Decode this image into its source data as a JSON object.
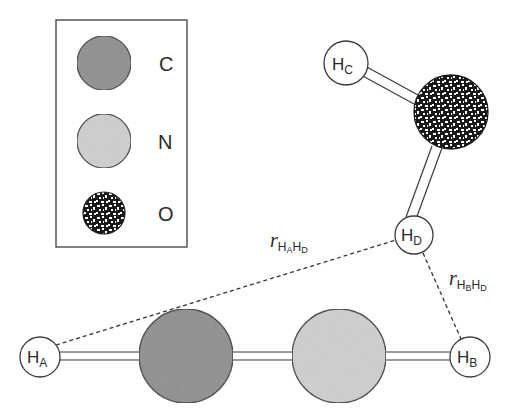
{
  "figure": {
    "type": "molecular-diagram"
  },
  "legend": {
    "items": [
      {
        "element": "C",
        "label": "C",
        "fill": "#8e8e8e",
        "pattern": "solid"
      },
      {
        "element": "N",
        "label": "N",
        "fill": "#cfcfcf",
        "pattern": "solid"
      },
      {
        "element": "O",
        "label": "O",
        "fill": "#1a1a1a",
        "pattern": "speckled"
      }
    ]
  },
  "atoms": {
    "HA": {
      "main": "H",
      "sub": "A"
    },
    "HB": {
      "main": "H",
      "sub": "B"
    },
    "HC": {
      "main": "H",
      "sub": "C"
    },
    "HD": {
      "main": "H",
      "sub": "D"
    },
    "C": {
      "element": "C"
    },
    "N": {
      "element": "N"
    },
    "O": {
      "element": "O"
    }
  },
  "distances": {
    "HAHD": {
      "symbol": "r",
      "sub1": "H",
      "sub1sub": "A",
      "sub2": "H",
      "sub2sub": "D"
    },
    "HBHD": {
      "symbol": "r",
      "sub1": "H",
      "sub1sub": "B",
      "sub2": "H",
      "sub2sub": "D"
    }
  },
  "colors": {
    "carbon": "#8e8e8e",
    "nitrogen": "#cfcfcf",
    "oxygen_dark": "#1a1a1a",
    "outline": "#3a3a3a",
    "background": "#ffffff"
  }
}
